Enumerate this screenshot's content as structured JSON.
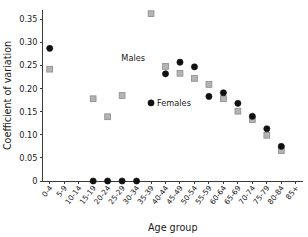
{
  "chart_data": {
    "type": "scatter",
    "title": "",
    "xlabel": "Age group",
    "ylabel": "Coefficient of variation",
    "ylim": [
      0,
      0.37
    ],
    "yticks": [
      0,
      0.05,
      0.1,
      0.15,
      0.2,
      0.25,
      0.3,
      0.35
    ],
    "ytick_labels": [
      "0",
      "0.05",
      "0.10",
      "0.15",
      "0.20",
      "0.25",
      "0.30",
      "0.35"
    ],
    "grid": false,
    "legend_position": "inline-annotation",
    "categories": [
      "0-4",
      "5-9",
      "10-14",
      "15-19",
      "20-24",
      "25-29",
      "30-34",
      "35-39",
      "40-44",
      "45-49",
      "50-54",
      "55-59",
      "60-64",
      "65-69",
      "70-74",
      "75-79",
      "80-84",
      "85+"
    ],
    "series": [
      {
        "name": "Males",
        "marker": "square",
        "color": "#b4b4b4",
        "values": [
          0.242,
          null,
          null,
          0.178,
          0.139,
          0.185,
          null,
          0.362,
          0.248,
          0.233,
          0.222,
          0.209,
          0.178,
          0.151,
          0.133,
          0.099,
          0.066,
          null
        ]
      },
      {
        "name": "Females",
        "marker": "circle",
        "color": "#111111",
        "values": [
          0.287,
          null,
          null,
          0.0,
          0.0,
          0.0,
          0.0,
          0.169,
          0.232,
          0.257,
          0.247,
          0.183,
          0.191,
          0.168,
          0.14,
          0.113,
          0.075,
          null
        ]
      }
    ],
    "annotations": [
      {
        "text": "Males",
        "x_category": "35-39",
        "y": 0.267,
        "align": "right-of-text"
      },
      {
        "text": "Females",
        "x_category": "35-39",
        "y": 0.169,
        "align": "left-of-text"
      }
    ]
  }
}
